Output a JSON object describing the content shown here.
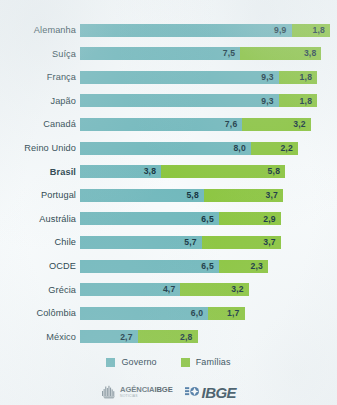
{
  "chart_data": {
    "type": "bar",
    "subtype": "stacked-horizontal",
    "title": "",
    "xlabel": "",
    "ylabel": "",
    "grid": false,
    "legend_position": "bottom-center",
    "xlim": [
      0,
      11.7
    ],
    "categories": [
      "Alemanha",
      "Suíça",
      "França",
      "Japão",
      "Canadá",
      "Reino Unido",
      "Brasil",
      "Portugal",
      "Austrália",
      "Chile",
      "OCDE",
      "Grécia",
      "Colômbia",
      "México"
    ],
    "series": [
      {
        "name": "Governo",
        "color": "#72b9bd",
        "values": [
          9.9,
          7.5,
          9.3,
          9.3,
          7.6,
          8.0,
          3.8,
          5.8,
          6.5,
          5.7,
          6.5,
          4.7,
          6.0,
          2.7
        ],
        "labels": [
          "9,9",
          "7,5",
          "9,3",
          "9,3",
          "7,6",
          "8,0",
          "3,8",
          "5,8",
          "6,5",
          "5,7",
          "6,5",
          "4,7",
          "6,0",
          "2,7"
        ]
      },
      {
        "name": "Famílias",
        "color": "#8cc63f",
        "values": [
          1.8,
          3.8,
          1.8,
          1.8,
          3.2,
          2.2,
          5.8,
          3.7,
          2.9,
          3.7,
          2.3,
          3.2,
          1.7,
          2.8
        ],
        "labels": [
          "1,8",
          "3,8",
          "1,8",
          "1,8",
          "3,2",
          "2,2",
          "5,8",
          "3,7",
          "2,9",
          "3,7",
          "2,3",
          "3,2",
          "1,7",
          "2,8"
        ]
      }
    ],
    "highlight_category": "Brasil"
  },
  "rows": [
    {
      "label": "Alemanha",
      "gov": 9.9,
      "fam": 1.8,
      "gov_label": "9,9",
      "fam_label": "1,8",
      "highlight": false
    },
    {
      "label": "Suíça",
      "gov": 7.5,
      "fam": 3.8,
      "gov_label": "7,5",
      "fam_label": "3,8",
      "highlight": false
    },
    {
      "label": "França",
      "gov": 9.3,
      "fam": 1.8,
      "gov_label": "9,3",
      "fam_label": "1,8",
      "highlight": false
    },
    {
      "label": "Japão",
      "gov": 9.3,
      "fam": 1.8,
      "gov_label": "9,3",
      "fam_label": "1,8",
      "highlight": false
    },
    {
      "label": "Canadá",
      "gov": 7.6,
      "fam": 3.2,
      "gov_label": "7,6",
      "fam_label": "3,2",
      "highlight": false
    },
    {
      "label": "Reino Unido",
      "gov": 8.0,
      "fam": 2.2,
      "gov_label": "8,0",
      "fam_label": "2,2",
      "highlight": false
    },
    {
      "label": "Brasil",
      "gov": 3.8,
      "fam": 5.8,
      "gov_label": "3,8",
      "fam_label": "5,8",
      "highlight": true
    },
    {
      "label": "Portugal",
      "gov": 5.8,
      "fam": 3.7,
      "gov_label": "5,8",
      "fam_label": "3,7",
      "highlight": false
    },
    {
      "label": "Austrália",
      "gov": 6.5,
      "fam": 2.9,
      "gov_label": "6,5",
      "fam_label": "2,9",
      "highlight": false
    },
    {
      "label": "Chile",
      "gov": 5.7,
      "fam": 3.7,
      "gov_label": "5,7",
      "fam_label": "3,7",
      "highlight": false
    },
    {
      "label": "OCDE",
      "gov": 6.5,
      "fam": 2.3,
      "gov_label": "6,5",
      "fam_label": "2,3",
      "highlight": false
    },
    {
      "label": "Grécia",
      "gov": 4.7,
      "fam": 3.2,
      "gov_label": "4,7",
      "fam_label": "3,2",
      "highlight": false
    },
    {
      "label": "Colômbia",
      "gov": 6.0,
      "fam": 1.7,
      "gov_label": "6,0",
      "fam_label": "1,7",
      "highlight": false
    },
    {
      "label": "México",
      "gov": 2.7,
      "fam": 2.8,
      "gov_label": "2,7",
      "fam_label": "2,8",
      "highlight": false
    }
  ],
  "legend": {
    "items": [
      {
        "label": "Governo",
        "color": "#72b9bd",
        "key": "gov"
      },
      {
        "label": "Famílias",
        "color": "#8cc63f",
        "key": "fam"
      }
    ]
  },
  "footer": {
    "agencia": {
      "text_main": "AGÊNCIA",
      "text_bold": "IBGE",
      "text_sub": "NOTÍCIAS"
    },
    "ibge": {
      "wordmark": "IBGE"
    }
  },
  "colors": {
    "governo": "#72b9bd",
    "familias": "#8cc63f",
    "background": "#f8fbfc",
    "label_text": "#223b46",
    "value_text": "#14333f"
  },
  "scale": {
    "axis_max": 11.7,
    "track_px": 250,
    "row_pitch_px": 23.6,
    "first_row_top_px": 22
  }
}
